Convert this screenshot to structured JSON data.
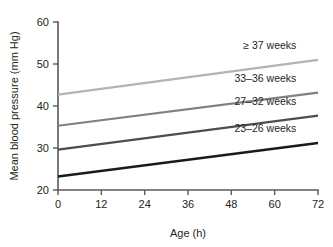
{
  "chart_data": {
    "type": "line",
    "title": "",
    "xlabel": "Age (h)",
    "ylabel": "Mean blood pressure (mm Hg)",
    "xlim": [
      0,
      72
    ],
    "ylim": [
      20,
      60
    ],
    "xticks": [
      0,
      12,
      24,
      36,
      48,
      60,
      72
    ],
    "yticks": [
      20,
      30,
      40,
      50,
      60
    ],
    "xtick_labels": [
      "0",
      "12",
      "24",
      "36",
      "48",
      "60",
      "72"
    ],
    "ytick_labels": [
      "20",
      "30",
      "40",
      "50",
      "60"
    ],
    "grid": false,
    "legend_position": "inline-right-of-lines",
    "series": [
      {
        "name": "≥ 37 weeks",
        "color": "#b3b3b3",
        "x": [
          0,
          72
        ],
        "values": [
          42.7,
          51.0
        ],
        "label_x": 66,
        "label_y": 53.6
      },
      {
        "name": "33–36 weeks",
        "color": "#808080",
        "x": [
          0,
          72
        ],
        "values": [
          35.3,
          43.2
        ],
        "label_x": 66,
        "label_y": 45.8
      },
      {
        "name": "27–32 weeks",
        "color": "#4d4d4d",
        "x": [
          0,
          72
        ],
        "values": [
          29.6,
          37.7
        ],
        "label_x": 66,
        "label_y": 40.2
      },
      {
        "name": "23–26 weeks",
        "color": "#1a1a1a",
        "x": [
          0,
          72
        ],
        "values": [
          23.2,
          31.2
        ],
        "label_x": 66,
        "label_y": 33.8
      }
    ]
  },
  "axes": {
    "x_label": "Age (h)",
    "y_label": "Mean blood pressure (mm Hg)"
  },
  "colors": {
    "axis": "#58595b",
    "text": "#231f20",
    "background": "#ffffff"
  }
}
